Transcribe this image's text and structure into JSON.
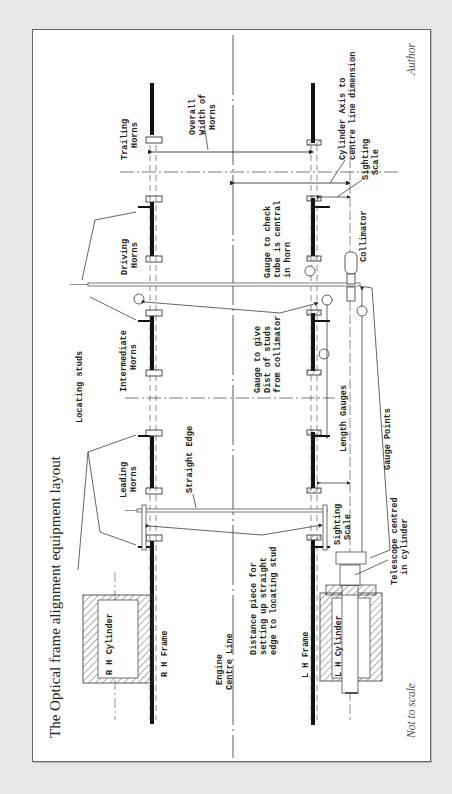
{
  "figure": {
    "title": "The Optical frame alignment equipment layout",
    "credit": "Author",
    "scale_note": "Not to scale",
    "orientation": "rotated 90° counter-clockwise"
  },
  "labels": {
    "trailing_horns": [
      "Trailing",
      "Horns"
    ],
    "driving_horns": [
      "Driving",
      "Horns"
    ],
    "intermediate_horns": [
      "Intermediate",
      "Horns"
    ],
    "leading_horns": [
      "Leading",
      "Horns"
    ],
    "overall_width": [
      "Overall",
      "Width of",
      "Horns"
    ],
    "cylinder_axis": [
      "Cylinder Axis to",
      "centre line dimension"
    ],
    "sighting_scale_top": [
      "Sighting",
      "Scale"
    ],
    "sighting_scale_bottom": [
      "Sighting",
      "Scale"
    ],
    "gauge_check": [
      "Gauge to check",
      "tube is central",
      "in horn"
    ],
    "collimator": "Collimator",
    "gauge_dist": [
      "Gauge to give",
      "Dist of studs",
      "from collimator"
    ],
    "length_gauges": "Length Gauges",
    "gauge_points": "Gauge Points",
    "locating_studs": "Locating studs",
    "straight_edge": "Straight Edge",
    "telescope": [
      "Telescope centred",
      "in cylinder"
    ],
    "distance_piece": [
      "Distance piece for",
      "setting up straight",
      "edge to locating stud"
    ],
    "rh_cylinder": "R H Cylinder",
    "rh_frame": "R H Frame",
    "engine_centre": [
      "Engine",
      "Centre Line"
    ],
    "lh_frame": "L H Frame",
    "lh_cylinder": "L H Cylinder"
  },
  "colors": {
    "background": "#e6e6e6",
    "panel": "#ffffff",
    "ink": "#222222"
  }
}
